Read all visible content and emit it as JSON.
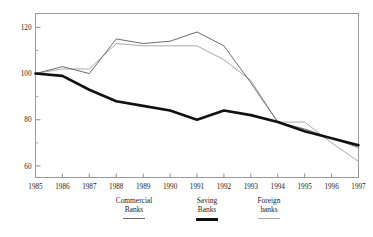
{
  "figure": {
    "clipped_header": "",
    "background": "#ffffff"
  },
  "legend": {
    "position": "below-plot",
    "items": [
      {
        "name": "commercial",
        "line1": "Commercial",
        "line2": "Banks",
        "swatch": "thin-line-swatch",
        "color": "#6d6d6d"
      },
      {
        "name": "saving",
        "line1": "Saving",
        "line2": "Banks",
        "swatch": "thick-line-swatch",
        "color": "#111111"
      },
      {
        "name": "foreign",
        "line1": "Foreign",
        "line2": "banks",
        "swatch": "light-line-swatch",
        "color": "#a9a9a9"
      }
    ]
  },
  "chart_data": {
    "type": "line",
    "title": "",
    "xlabel": "",
    "ylabel": "",
    "grid": false,
    "legend_position": "bottom",
    "x": [
      1985,
      1986,
      1987,
      1988,
      1989,
      1990,
      1991,
      1992,
      1993,
      1994,
      1995,
      1996,
      1997
    ],
    "categories": [
      "1985",
      "1986",
      "1987",
      "1988",
      "1989",
      "1990",
      "1991",
      "1992",
      "1993",
      "1994",
      "1995",
      "1996",
      "1997"
    ],
    "xtick_labels": [
      "1985",
      "1986",
      "1987",
      "1988",
      "1989",
      "1990",
      "1991",
      "1992",
      "1993",
      "1994",
      "1995",
      "1996",
      "1997"
    ],
    "ytick_labels": [
      "60",
      "80",
      "100",
      "120"
    ],
    "yticks": [
      60,
      80,
      100,
      120
    ],
    "yticks_minor": [
      70,
      90,
      110
    ],
    "ylim": [
      55,
      126
    ],
    "xlim": [
      1985,
      1997
    ],
    "series": [
      {
        "name": "Commercial Banks",
        "color": "#6d6d6d",
        "linewidth": 1,
        "values": [
          100,
          103,
          100,
          115,
          113,
          114,
          118,
          112,
          96,
          79,
          76,
          72,
          68
        ]
      },
      {
        "name": "Saving Banks",
        "color": "#111111",
        "linewidth": 2.6,
        "values": [
          100,
          99,
          93,
          88,
          86,
          84,
          80,
          84,
          82,
          79,
          75,
          72,
          69
        ]
      },
      {
        "name": "Foreign banks",
        "color": "#a9a9a9",
        "linewidth": 1,
        "values": [
          100,
          102,
          102,
          113,
          112,
          112,
          112,
          106,
          97,
          79,
          79,
          70,
          62
        ]
      }
    ]
  }
}
